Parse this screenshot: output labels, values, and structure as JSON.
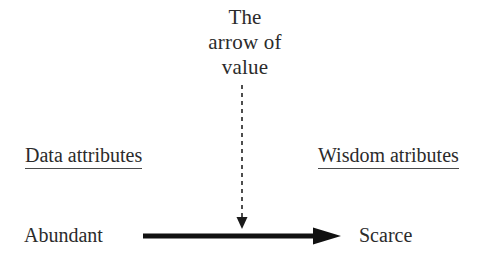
{
  "canvas": {
    "width": 490,
    "height": 265,
    "background": "#ffffff",
    "ink": "#2b2b2b",
    "arrow_color": "#111111",
    "rule_color": "#4a4a4a"
  },
  "title": {
    "lines": [
      "The",
      "arrow of",
      "value"
    ],
    "full_text": "The arrow of value"
  },
  "axis": {
    "left_label": "Data attributes",
    "right_label": "Wisdom atributes"
  },
  "endpoints": {
    "start_label": "Abundant",
    "end_label": "Scarce"
  },
  "arrows": {
    "value_arrow": {
      "icon": "dashed-down-arrow-icon",
      "style": "dashed",
      "direction": "down",
      "from": [
        242,
        85
      ],
      "to": [
        242,
        228
      ]
    },
    "spectrum_arrow": {
      "icon": "solid-right-arrow-icon",
      "style": "solid",
      "direction": "right",
      "from": [
        143,
        236
      ],
      "to": [
        340,
        236
      ],
      "thickness": 5
    }
  }
}
